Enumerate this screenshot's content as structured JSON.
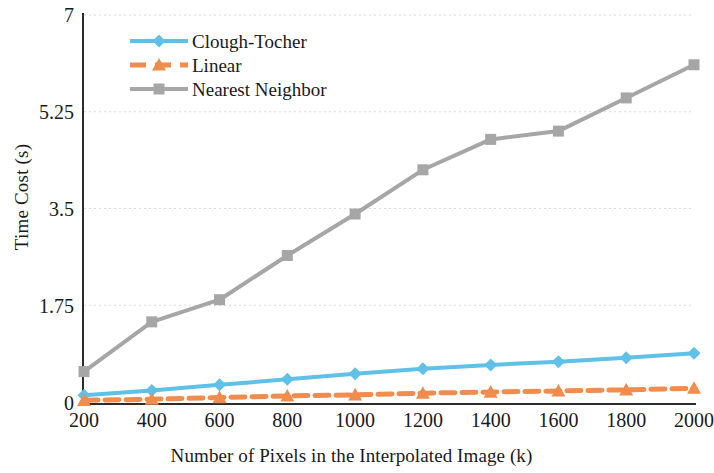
{
  "chart_data": {
    "type": "line",
    "title": "",
    "xlabel": "Number of Pixels in the Interpolated Image (k)",
    "ylabel": "Time Cost (s)",
    "x": [
      200,
      400,
      600,
      800,
      1000,
      1200,
      1400,
      1600,
      1800,
      2000
    ],
    "xticklabels": [
      "200",
      "400",
      "600",
      "800",
      "1000",
      "1200",
      "1400",
      "1600",
      "1800",
      "2000"
    ],
    "yticks": [
      0,
      1.75,
      3.5,
      5.25,
      7
    ],
    "yticklabels": [
      "0",
      "1.75",
      "3.5",
      "5.25",
      "7"
    ],
    "xlim": [
      200,
      2000
    ],
    "ylim": [
      0,
      7
    ],
    "grid": "horizontal-dotted",
    "legend_position": "top-left-inside",
    "series": [
      {
        "name": "Clough-Tocher",
        "color": "#5FC0E8",
        "marker": "diamond",
        "linestyle": "solid",
        "values": [
          0.12,
          0.21,
          0.31,
          0.41,
          0.51,
          0.6,
          0.67,
          0.73,
          0.8,
          0.88
        ]
      },
      {
        "name": "Linear",
        "color": "#F08C4E",
        "marker": "triangle",
        "linestyle": "dashed",
        "values": [
          0.03,
          0.05,
          0.08,
          0.11,
          0.13,
          0.16,
          0.18,
          0.2,
          0.22,
          0.25
        ]
      },
      {
        "name": "Nearest Neighbor",
        "color": "#A6A6A6",
        "marker": "square",
        "linestyle": "solid",
        "values": [
          0.55,
          1.45,
          1.85,
          2.65,
          3.4,
          4.2,
          4.75,
          4.9,
          5.5,
          6.1
        ]
      }
    ]
  },
  "legend": {
    "items": [
      {
        "label": "Clough-Tocher"
      },
      {
        "label": "Linear"
      },
      {
        "label": "Nearest Neighbor"
      }
    ]
  },
  "axes": {
    "y_title": "Time Cost (s)",
    "x_title": "Number of Pixels in the Interpolated Image (k)"
  }
}
